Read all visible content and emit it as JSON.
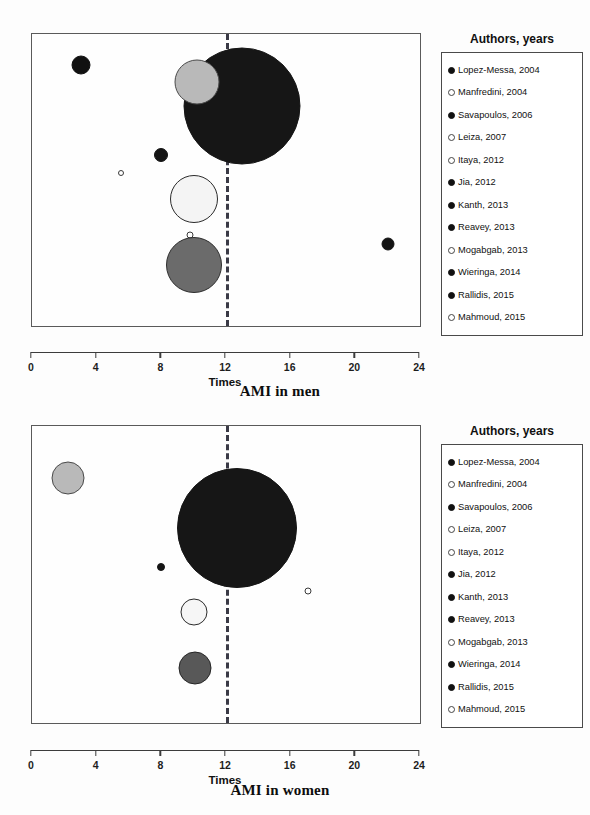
{
  "figure": {
    "legend_title": "Authors, years",
    "xlabel": "Times",
    "xticks": [
      "0",
      "4",
      "8",
      "12",
      "16",
      "20",
      "24"
    ]
  },
  "legend": {
    "title": "Authors, years",
    "items": [
      {
        "label": "Lopez-Messa, 2004",
        "marker": "filled"
      },
      {
        "label": "Manfredini, 2004",
        "marker": "hollow"
      },
      {
        "label": "Savapoulos, 2006",
        "marker": "filled"
      },
      {
        "label": "Leiza, 2007",
        "marker": "hollow"
      },
      {
        "label": "Itaya, 2012",
        "marker": "hollow"
      },
      {
        "label": "Jia, 2012",
        "marker": "filled"
      },
      {
        "label": "Kanth, 2013",
        "marker": "filled"
      },
      {
        "label": "Reavey, 2013",
        "marker": "filled"
      },
      {
        "label": "Mogabgab, 2013",
        "marker": "hollow"
      },
      {
        "label": "Wieringa, 2014",
        "marker": "filled"
      },
      {
        "label": "Rallidis, 2015",
        "marker": "filled"
      },
      {
        "label": "Mahmoud, 2015",
        "marker": "hollow"
      }
    ]
  },
  "panels": [
    {
      "id": "ami-in-men",
      "caption": "AMI in men",
      "legend_title": "Authors, years",
      "xlabel": "Times"
    },
    {
      "id": "ami-in-women",
      "caption": "AMI in women",
      "legend_title": "Authors, years",
      "xlabel": "Times"
    }
  ],
  "chart_data": [
    {
      "type": "scatter",
      "title": "AMI in men",
      "xlabel": "Times",
      "ylabel": "",
      "xlim": [
        0,
        24
      ],
      "grid": false,
      "legend_position": "right",
      "reference_line": {
        "x": 12,
        "style": "dashed",
        "color": "#3a3a46"
      },
      "annotations": [
        "Bubble area proportional to study weight"
      ],
      "points": [
        {
          "name": "Lopez-Messa, 2004",
          "x": 22.0,
          "y": 0.72,
          "size": 13,
          "fill": "#141414",
          "edge": "#141414"
        },
        {
          "name": "Manfredini, 2004",
          "x": 5.5,
          "y": 0.475,
          "size": 6,
          "fill": "#ffffff",
          "edge": "#3a3a3a"
        },
        {
          "name": "Savapoulos, 2006",
          "x": 8.0,
          "y": 0.415,
          "size": 14,
          "fill": "#141414",
          "edge": "#141414"
        },
        {
          "name": "Leiza, 2007",
          "x": 10.0,
          "y": 0.565,
          "size": 48,
          "fill": "#f4f4f4",
          "edge": "#2b2b2b"
        },
        {
          "name": "Itaya, 2012",
          "x": 9.8,
          "y": 0.69,
          "size": 7,
          "fill": "#ffffff",
          "edge": "#3a3a3a"
        },
        {
          "name": "Jia, 2012",
          "x": 10.0,
          "y": 0.79,
          "size": 56,
          "fill": "#6b6b6b",
          "edge": "#2e2e2e"
        },
        {
          "name": "Kanth, 2013",
          "x": 13.0,
          "y": 0.245,
          "size": 117,
          "fill": "#161616",
          "edge": "#161616"
        },
        {
          "name": "Reavey, 2013",
          "x": 3.0,
          "y": 0.105,
          "size": 19,
          "fill": "#111111",
          "edge": "#111111"
        },
        {
          "name": "Mogabgab, 2013",
          "x": 10.2,
          "y": 0.165,
          "size": 45,
          "fill": "#b9b9b9",
          "edge": "#4a4a4a"
        }
      ]
    },
    {
      "type": "scatter",
      "title": "AMI in women",
      "xlabel": "Times",
      "ylabel": "",
      "xlim": [
        0,
        24
      ],
      "grid": false,
      "legend_position": "right",
      "reference_line": {
        "x": 12,
        "style": "dashed",
        "color": "#3a3a46"
      },
      "annotations": [
        "Bubble area proportional to study weight"
      ],
      "points": [
        {
          "name": "Jia, 2012",
          "x": 10.1,
          "y": 0.815,
          "size": 33,
          "fill": "#585858",
          "edge": "#262626"
        },
        {
          "name": "Leiza, 2007",
          "x": 10.0,
          "y": 0.625,
          "size": 27,
          "fill": "#f6f6f6",
          "edge": "#2b2b2b"
        },
        {
          "name": "Mahmoud, 2015",
          "x": 17.1,
          "y": 0.555,
          "size": 7,
          "fill": "#ffffff",
          "edge": "#3a3a3a"
        },
        {
          "name": "Savapoulos, 2006",
          "x": 8.0,
          "y": 0.475,
          "size": 8,
          "fill": "#141414",
          "edge": "#141414"
        },
        {
          "name": "Kanth, 2013",
          "x": 12.7,
          "y": 0.345,
          "size": 120,
          "fill": "#161616",
          "edge": "#161616"
        },
        {
          "name": "Mogabgab, 2013",
          "x": 2.2,
          "y": 0.175,
          "size": 33,
          "fill": "#b9b9b9",
          "edge": "#4a4a4a"
        }
      ]
    }
  ]
}
